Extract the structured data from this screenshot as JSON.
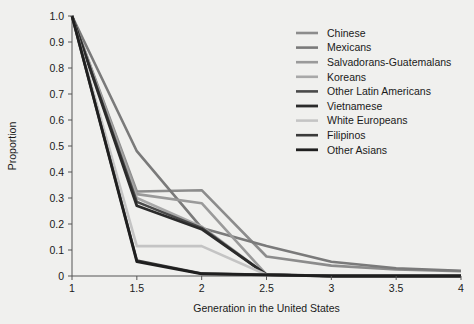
{
  "chart_data": {
    "type": "line",
    "title": "",
    "xlabel": "Generation in the United States",
    "ylabel": "Proportion",
    "xlim": [
      1,
      4
    ],
    "ylim": [
      0,
      1.0
    ],
    "grid": false,
    "legend_position": "top-right",
    "xticks": [
      "1",
      "1.5",
      "2",
      "2.5",
      "3",
      "3.5",
      "4"
    ],
    "xtick_values": [
      1,
      1.5,
      2,
      2.5,
      3,
      3.5,
      4
    ],
    "yticks": [
      "0",
      "0.1",
      "0.2",
      "0.3",
      "0.4",
      "0.5",
      "0.6",
      "0.7",
      "0.8",
      "0.9",
      "1.0"
    ],
    "ytick_values": [
      0,
      0.1,
      0.2,
      0.3,
      0.4,
      0.5,
      0.6,
      0.7,
      0.8,
      0.9,
      1.0
    ],
    "x": [
      1,
      1.5,
      2,
      2.5,
      3,
      3.5,
      4
    ],
    "series": [
      {
        "name": "Chinese",
        "color": "#8c8c8c",
        "width": 2.6,
        "values": [
          1.0,
          0.325,
          0.33,
          0.075,
          0.04,
          0.025,
          0.018
        ]
      },
      {
        "name": "Mexicans",
        "color": "#7a7a7a",
        "width": 2.6,
        "values": [
          1.0,
          0.48,
          0.185,
          0.115,
          0.055,
          0.03,
          0.02
        ]
      },
      {
        "name": "Salvadorans-Guatemalans",
        "color": "#9a9a9a",
        "width": 2.6,
        "values": [
          1.0,
          0.315,
          0.28,
          0.005,
          0.0,
          0.0,
          0.0
        ]
      },
      {
        "name": "Koreans",
        "color": "#a8a8a8",
        "width": 2.6,
        "values": [
          1.0,
          0.3,
          0.19,
          0.005,
          0.0,
          0.0,
          0.0
        ]
      },
      {
        "name": "Other Latin Americans",
        "color": "#4a4a4a",
        "width": 2.6,
        "values": [
          1.0,
          0.285,
          0.185,
          0.005,
          0.0,
          0.0,
          0.0
        ]
      },
      {
        "name": "Vietnamese",
        "color": "#2b2b2b",
        "width": 2.8,
        "values": [
          1.0,
          0.27,
          0.18,
          0.005,
          0.0,
          0.0,
          0.0
        ]
      },
      {
        "name": "White Europeans",
        "color": "#c4c4c4",
        "width": 2.6,
        "values": [
          1.0,
          0.115,
          0.115,
          0.005,
          0.0,
          0.0,
          0.0
        ]
      },
      {
        "name": "Filipinos",
        "color": "#3a3a3a",
        "width": 2.6,
        "values": [
          1.0,
          0.06,
          0.01,
          0.005,
          0.0,
          0.0,
          0.0
        ]
      },
      {
        "name": "Other Asians",
        "color": "#1f1f1f",
        "width": 2.8,
        "values": [
          1.0,
          0.055,
          0.008,
          0.004,
          0.0,
          0.0,
          0.0
        ]
      }
    ]
  },
  "legend": {
    "entries": [
      "Chinese",
      "Mexicans",
      "Salvadorans-Guatemalans",
      "Koreans",
      "Other Latin Americans",
      "Vietnamese",
      "White Europeans",
      "Filipinos",
      "Other Asians"
    ]
  },
  "colors": {
    "background": "#f0f0ee",
    "axis": "#555555",
    "text": "#1a1a1a"
  }
}
